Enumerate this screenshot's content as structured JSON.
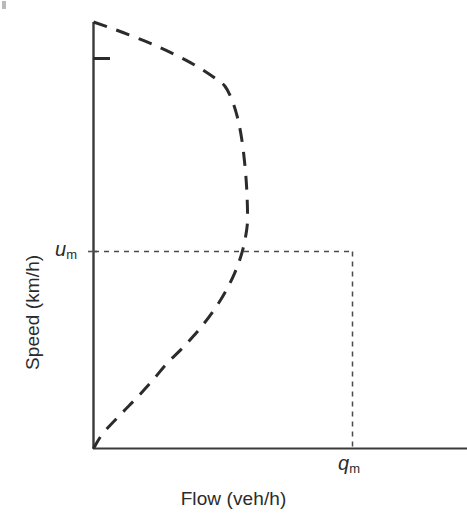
{
  "figure": {
    "kind": "speed-flow-diagram",
    "background_color": "#ffffff",
    "ink_color": "#2b2b2b"
  },
  "axes": {
    "x_title": "Flow (veh/h)",
    "y_title": "Speed (km/h)"
  },
  "annotations": {
    "um": {
      "symbol": "u",
      "subscript": "m"
    },
    "qm": {
      "symbol": "q",
      "subscript": "m"
    }
  },
  "chart_data": {
    "type": "line",
    "title": "",
    "xlabel": "Flow (veh/h)",
    "ylabel": "Speed (km/h)",
    "grid": false,
    "legend": null,
    "xlim": [
      0,
      1.28
    ],
    "ylim": [
      0,
      1.0
    ],
    "curve_style": {
      "linestyle": "dashed",
      "dash_pattern": "14 10",
      "color": "#2b2b2b",
      "linewidth": 3
    },
    "series": [
      {
        "name": "Greenshields speed-flow curve",
        "description": "Parabolic speed-flow relationship; flow is maximum (q_m) at the optimum speed u_m, which is half the free-flow speed.",
        "x": [
          0.0,
          0.063,
          0.122,
          0.177,
          0.228,
          0.275,
          0.318,
          0.357,
          0.392,
          0.423,
          0.45,
          0.473,
          0.492,
          0.507,
          0.518,
          0.525,
          0.528,
          0.527,
          0.522,
          0.513,
          0.5,
          0.483,
          0.462,
          0.437,
          0.408,
          0.375,
          0.338,
          0.297,
          0.252,
          0.203,
          0.15,
          0.093,
          0.032,
          0.0
        ],
        "y": [
          1.0,
          0.985,
          0.97,
          0.955,
          0.94,
          0.925,
          0.91,
          0.895,
          0.88,
          0.865,
          0.85,
          0.82,
          0.78,
          0.73,
          0.67,
          0.61,
          0.55,
          0.525,
          0.5,
          0.47,
          0.44,
          0.41,
          0.38,
          0.35,
          0.32,
          0.29,
          0.26,
          0.23,
          0.2,
          0.16,
          0.12,
          0.08,
          0.035,
          0.0
        ]
      }
    ],
    "markers": [
      {
        "name": "capacity-point",
        "label_x": "q_m",
        "label_y": "u_m",
        "x": 0.528,
        "y": 0.528,
        "guideline_style": "dotted"
      }
    ],
    "reference_lines": [
      {
        "name": "um-horizontal-guideline",
        "orientation": "horizontal",
        "value": 0.528,
        "style": "dotted"
      },
      {
        "name": "qm-vertical-guideline",
        "orientation": "vertical",
        "value": 0.528,
        "style": "dotted"
      }
    ],
    "tick_labels": {
      "x": [
        "q_m"
      ],
      "y": [
        "u_m"
      ]
    }
  }
}
